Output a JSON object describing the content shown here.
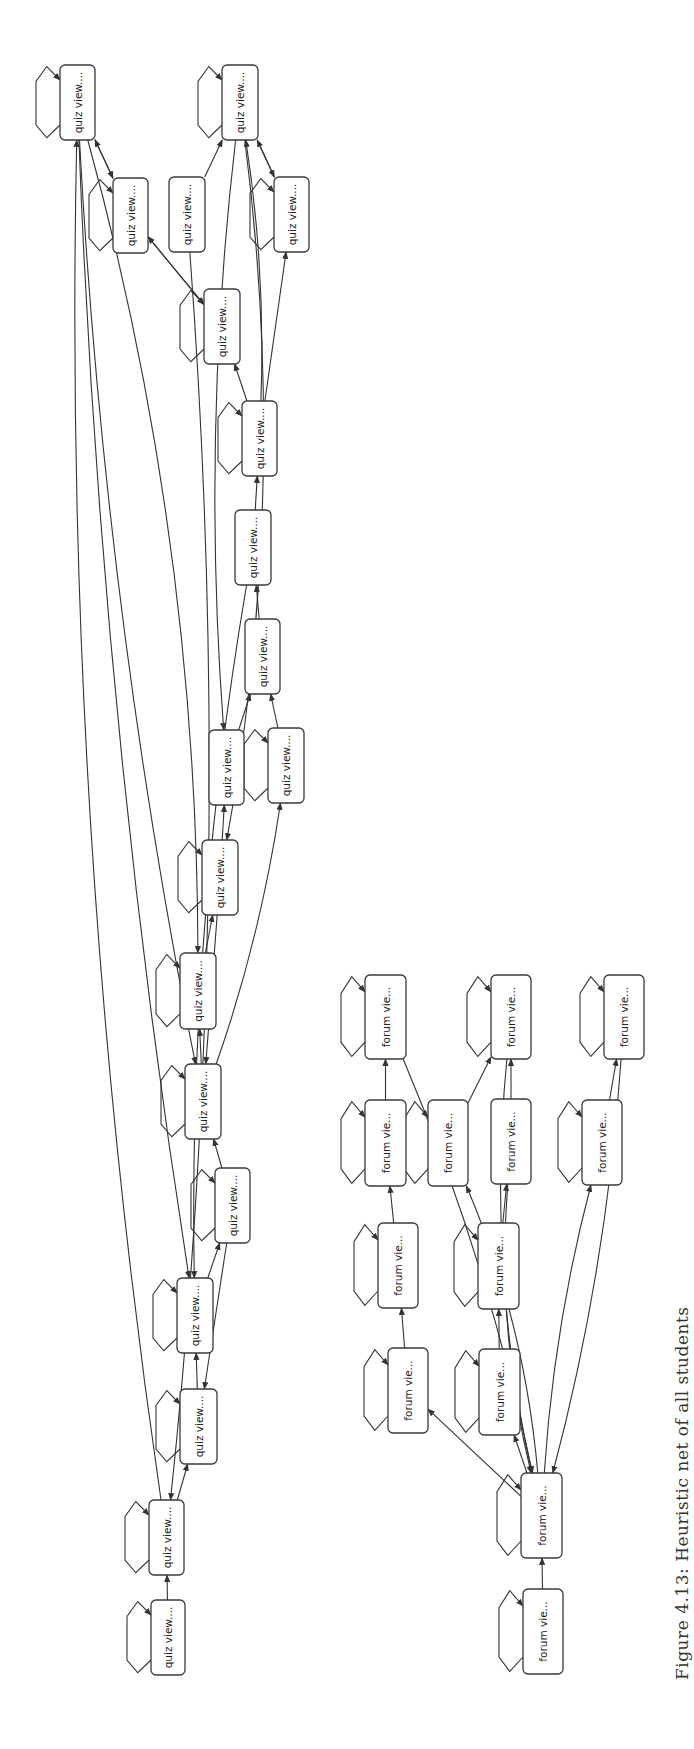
{
  "figure": {
    "caption": "Figure 4.13: Heuristic net of all students",
    "graphs": [
      {
        "name": "quiz-graph",
        "node_label": "quiz view....",
        "nodes": [
          "Q1",
          "Q2",
          "Q3",
          "Q4",
          "Q5",
          "Q6",
          "Q7",
          "Q8",
          "Q9",
          "Q10",
          "Q11",
          "Q12",
          "Q13",
          "Q14",
          "Q15",
          "Q16",
          "Q17",
          "Q18",
          "Q19"
        ],
        "self_loops": [
          "Q1",
          "Q2",
          "Q3",
          "Q5",
          "Q6",
          "Q7",
          "Q11",
          "Q12",
          "Q13",
          "Q14",
          "Q15",
          "Q16",
          "Q17",
          "Q18",
          "Q19"
        ],
        "edges": [
          [
            "Q19",
            "Q18"
          ],
          [
            "Q18",
            "Q17"
          ],
          [
            "Q17",
            "Q16"
          ],
          [
            "Q16",
            "Q15"
          ],
          [
            "Q15",
            "Q14"
          ],
          [
            "Q14",
            "Q13"
          ],
          [
            "Q13",
            "Q12"
          ],
          [
            "Q12",
            "Q10"
          ],
          [
            "Q10",
            "Q9"
          ],
          [
            "Q11",
            "Q9"
          ],
          [
            "Q9",
            "Q8"
          ],
          [
            "Q8",
            "Q7"
          ],
          [
            "Q7",
            "Q6"
          ],
          [
            "Q7",
            "Q5"
          ],
          [
            "Q7",
            "Q2"
          ],
          [
            "Q5",
            "Q2"
          ],
          [
            "Q2",
            "Q5"
          ],
          [
            "Q4",
            "Q2"
          ],
          [
            "Q3",
            "Q1"
          ],
          [
            "Q1",
            "Q3"
          ],
          [
            "Q3",
            "Q6"
          ],
          [
            "Q6",
            "Q3"
          ],
          [
            "Q2",
            "Q10"
          ],
          [
            "Q1",
            "Q13"
          ],
          [
            "Q1",
            "Q16"
          ],
          [
            "Q18",
            "Q1"
          ],
          [
            "Q14",
            "Q11"
          ],
          [
            "Q12",
            "Q14"
          ],
          [
            "Q15",
            "Q17"
          ],
          [
            "Q4",
            "Q18"
          ],
          [
            "Q8",
            "Q16"
          ],
          [
            "Q2",
            "Q12"
          ],
          [
            "Q1",
            "Q14"
          ]
        ]
      },
      {
        "name": "forum-graph",
        "node_label": "forum vie...",
        "nodes": [
          "F1",
          "F2",
          "F3",
          "F4",
          "F5",
          "F6",
          "F7",
          "F8",
          "F9",
          "F10",
          "F11",
          "F12",
          "F13"
        ],
        "self_loops": [
          "F1",
          "F2",
          "F3",
          "F4",
          "F5",
          "F7",
          "F8",
          "F9",
          "F10",
          "F11",
          "F12",
          "F13"
        ],
        "edges": [
          [
            "F13",
            "F12"
          ],
          [
            "F12",
            "F10"
          ],
          [
            "F12",
            "F11"
          ],
          [
            "F10",
            "F8"
          ],
          [
            "F8",
            "F4"
          ],
          [
            "F4",
            "F1"
          ],
          [
            "F11",
            "F9"
          ],
          [
            "F9",
            "F6"
          ],
          [
            "F6",
            "F2"
          ],
          [
            "F5",
            "F2"
          ],
          [
            "F7",
            "F3"
          ],
          [
            "F2",
            "F12"
          ],
          [
            "F3",
            "F12"
          ],
          [
            "F6",
            "F12"
          ],
          [
            "F12",
            "F7"
          ],
          [
            "F12",
            "F5"
          ],
          [
            "F1",
            "F12"
          ]
        ]
      }
    ]
  }
}
